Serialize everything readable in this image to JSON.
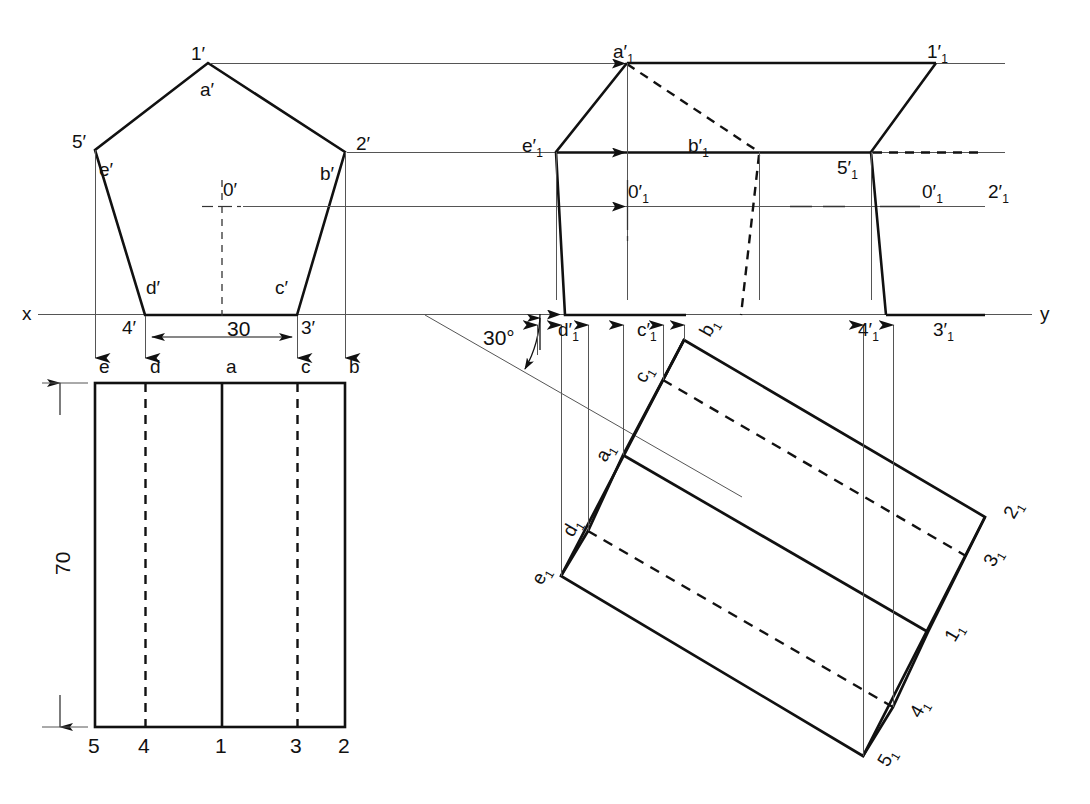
{
  "drawing": {
    "title": "Orthographic projection of a pentagonal prism with auxiliary view",
    "background_color": "#ffffff",
    "line_color": "#111111",
    "thin_line_color": "#555555",
    "axis_label_x": "x",
    "axis_label_y": "y"
  },
  "dimensions": {
    "width_30": "30",
    "height_70": "70",
    "angle_30deg": "30°"
  },
  "front_view": {
    "name": "pentagon-front-view",
    "vertices": [
      {
        "label": "1′",
        "x": 208,
        "y": 63
      },
      {
        "label": "5′",
        "x": 95,
        "y": 150
      },
      {
        "label": "2′",
        "x": 345,
        "y": 152
      },
      {
        "label": "4′",
        "x": 145,
        "y": 315
      },
      {
        "label": "3′",
        "x": 297,
        "y": 315
      }
    ],
    "inner_labels": [
      {
        "label": "a′"
      },
      {
        "label": "b′"
      },
      {
        "label": "c′"
      },
      {
        "label": "d′"
      },
      {
        "label": "e′"
      },
      {
        "label": "0′"
      }
    ]
  },
  "top_view": {
    "name": "rectangle-top-view",
    "top_labels": [
      "e",
      "d",
      "a",
      "c",
      "b"
    ],
    "bottom_labels": [
      "5",
      "4",
      "1",
      "3",
      "2"
    ]
  },
  "auxiliary_view": {
    "name": "auxiliary-elevation-view",
    "labels": [
      "a′₁",
      "1′₁",
      "e′₁",
      "b′₁",
      "5′₁",
      "2′₁",
      "0′₁",
      "d′₁",
      "c′₁",
      "4′₁",
      "3′₁"
    ]
  },
  "inclined_view": {
    "name": "inclined-prism-view",
    "labels": [
      "a₁",
      "b₁",
      "c₁",
      "d₁",
      "e₁",
      "1₁",
      "2₁",
      "3₁",
      "4₁",
      "5₁"
    ]
  },
  "labels": {
    "v1p": "1′",
    "v2p": "2′",
    "v3p": "3′",
    "v4p": "4′",
    "v5p": "5′",
    "ap": "a′",
    "bp": "b′",
    "cp": "c′",
    "dp": "d′",
    "ep": "e′",
    "zerop": "0′",
    "x": "x",
    "y": "y",
    "dim30": "30",
    "dim70": "70",
    "ang30": "30°",
    "te": "e",
    "td": "d",
    "ta": "a",
    "tc": "c",
    "tb": "b",
    "b5": "5",
    "b4": "4",
    "b1": "1",
    "b3": "3",
    "b2": "2",
    "aux_a": "a′",
    "aux_b": "b′",
    "aux_c": "c′",
    "aux_d": "d′",
    "aux_e": "e′",
    "aux_zero": "0′",
    "aux_1": "1′",
    "aux_2": "2′",
    "aux_3": "3′",
    "aux_4": "4′",
    "aux_5": "5′",
    "sub1": "1",
    "inc_a": "a",
    "inc_b": "b",
    "inc_c": "c",
    "inc_d": "d",
    "inc_e": "e",
    "inc_1": "1",
    "inc_2": "2",
    "inc_3": "3",
    "inc_4": "4",
    "inc_5": "5"
  }
}
